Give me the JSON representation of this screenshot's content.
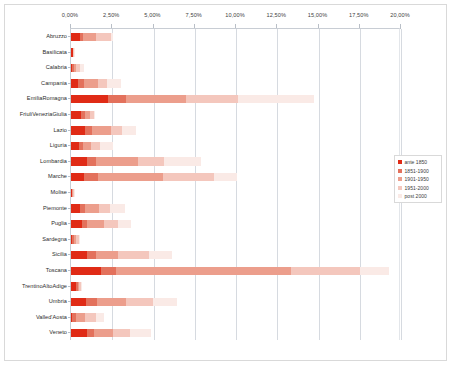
{
  "chart_data": {
    "type": "bar",
    "orientation": "horizontal",
    "stacked": true,
    "title": "",
    "subtitle": "",
    "xlabel": "",
    "ylabel": "",
    "xlim": [
      0,
      20
    ],
    "xtick_labels": [
      "0,00%",
      "2,50%",
      "5,00%",
      "7,50%",
      "10,00%",
      "12,50%",
      "15,00%",
      "17,50%",
      "20,00%"
    ],
    "xtick_values": [
      0,
      2.5,
      5,
      7.5,
      10,
      12.5,
      15,
      17.5,
      20
    ],
    "grid": true,
    "legend_position": "right",
    "value_unit": "percent",
    "categories": [
      "Abruzzo",
      "Basilicata",
      "Calabria",
      "Campania",
      "EmiliaRomagna",
      "FriuliVeneziaGiulia",
      "Lazio",
      "Liguria",
      "Lombardia",
      "Marche",
      "Molise",
      "Piemonte",
      "Puglia",
      "Sardegna",
      "Sicilia",
      "Toscana",
      "TrentinoAltoAdige",
      "Umbria",
      "Valled'Aosta",
      "Veneto"
    ],
    "series": [
      {
        "name": "ante 1850",
        "color": "#e02b16",
        "values": [
          0.55,
          0.1,
          0.06,
          0.45,
          2.25,
          0.6,
          0.85,
          0.5,
          0.95,
          0.8,
          0.05,
          0.55,
          0.65,
          0.06,
          0.95,
          1.8,
          0.3,
          0.9,
          0.05,
          0.95
        ]
      },
      {
        "name": "1851-1900",
        "color": "#e3715c",
        "values": [
          0.2,
          0.02,
          0.1,
          0.35,
          1.1,
          0.25,
          0.45,
          0.25,
          0.55,
          0.85,
          0.04,
          0.3,
          0.35,
          0.1,
          0.55,
          0.9,
          0.1,
          0.7,
          0.25,
          0.45
        ]
      },
      {
        "name": "1901-1950",
        "color": "#ec9e8c",
        "values": [
          0.75,
          0.02,
          0.15,
          0.85,
          3.65,
          0.3,
          1.1,
          0.45,
          2.55,
          3.9,
          0.04,
          0.85,
          1.0,
          0.15,
          1.35,
          10.65,
          0.1,
          1.75,
          0.55,
          1.15
        ]
      },
      {
        "name": "1951-2000",
        "color": "#f4c7bd"
      },
      {
        "name": "post 2000",
        "color": "#faeae6"
      }
    ],
    "series_1951_2000_values": [
      0.95,
      0.02,
      0.25,
      0.55,
      3.15,
      0.25,
      0.7,
      0.55,
      1.6,
      3.1,
      0.04,
      0.65,
      0.85,
      0.15,
      1.85,
      4.15,
      0.12,
      1.6,
      0.65,
      1.05
    ],
    "series_post2000_values": [
      0.1,
      0.01,
      0.25,
      0.85,
      4.55,
      0.02,
      0.85,
      0.8,
      2.25,
      1.4,
      0.02,
      0.9,
      0.8,
      0.1,
      1.4,
      1.8,
      0.02,
      1.45,
      0.5,
      1.25
    ],
    "totals": [
      2.55,
      0.17,
      0.81,
      3.05,
      14.7,
      1.42,
      3.95,
      2.55,
      7.9,
      10.05,
      0.19,
      3.25,
      3.65,
      0.56,
      6.1,
      19.3,
      0.64,
      6.4,
      2.0,
      4.85
    ],
    "legend_entries": [
      "ante 1850",
      "1851-1900",
      "1901-1950",
      "1951-2000",
      "post 2000"
    ]
  }
}
